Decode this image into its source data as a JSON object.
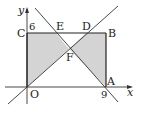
{
  "diagram": {
    "type": "coordinate-geometry",
    "axes": {
      "x_label": "x",
      "y_label": "y",
      "origin_label": "O",
      "x_tick_label": "9",
      "y_tick_label": "6"
    },
    "points": [
      {
        "name": "O",
        "label": "O",
        "coord": [
          0,
          0
        ]
      },
      {
        "name": "A",
        "label": "A",
        "coord": [
          9,
          0
        ]
      },
      {
        "name": "B",
        "label": "B",
        "coord": [
          9,
          6
        ]
      },
      {
        "name": "C",
        "label": "C",
        "coord": [
          0,
          6
        ]
      },
      {
        "name": "D",
        "label": "D"
      },
      {
        "name": "E",
        "label": "E"
      },
      {
        "name": "F",
        "label": "F"
      }
    ],
    "rectangle": "OABC",
    "lines": [
      {
        "name": "line-through-O-F-D",
        "description": "ascending line through O, F, D"
      },
      {
        "name": "line-through-E-F-A",
        "description": "descending line through E, F, A"
      }
    ],
    "shaded_regions": [
      "O-F-E-C",
      "F-D-B-A"
    ],
    "colors": {
      "shade": "#d4d4d4",
      "stroke": "#333333",
      "rect_stroke": "#222222"
    }
  }
}
